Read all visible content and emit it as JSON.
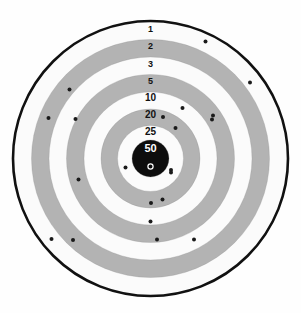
{
  "target": {
    "title": "Shooting Target",
    "center": {
      "x": 150.5,
      "y": 158.5
    },
    "background_color": "#fefefe",
    "band_color_gray": "#b3b3b3",
    "band_color_white": "#fbfbfb",
    "outline_color": "#111111",
    "bullseye_color": "#0d0d0d",
    "bullet_hole_color": "#1a1a1a",
    "outer_rim": {
      "name": "outer-rim",
      "radius": 137.5,
      "stroke_width": 2.6,
      "stroke_color": "#111111"
    },
    "rings": [
      {
        "label": "1",
        "score": 1,
        "outer_radius": 136.0,
        "inner_radius": 119.0,
        "fill": "#fbfbfb",
        "label_y": 31.5
      },
      {
        "label": "2",
        "score": 2,
        "outer_radius": 119.0,
        "inner_radius": 101.5,
        "fill": "#b3b3b3",
        "label_y": 49.0
      },
      {
        "label": "3",
        "score": 3,
        "outer_radius": 101.5,
        "inner_radius": 84.0,
        "fill": "#fbfbfb",
        "label_y": 66.5
      },
      {
        "label": "5",
        "score": 5,
        "outer_radius": 84.0,
        "inner_radius": 66.5,
        "fill": "#b3b3b3",
        "label_y": 84.0
      },
      {
        "label": "10",
        "score": 10,
        "outer_radius": 66.5,
        "inner_radius": 49.5,
        "fill": "#fbfbfb",
        "label_y": 101.0
      },
      {
        "label": "20",
        "score": 20,
        "outer_radius": 49.5,
        "inner_radius": 33.0,
        "fill": "#b3b3b3",
        "label_y": 118.0
      },
      {
        "label": "25",
        "score": 25,
        "outer_radius": 33.0,
        "inner_radius": 18.5,
        "fill": "#fbfbfb",
        "label_y": 134.5
      },
      {
        "label": "50",
        "score": 50,
        "outer_radius": 18.5,
        "inner_radius": 0.0,
        "fill": "#0d0d0d",
        "label_y": 151.5
      }
    ],
    "aim_marker": {
      "name": "aim-point-marker",
      "cx": 150.5,
      "cy": 166.5,
      "radius": 2.6,
      "stroke_color": "#ffffff",
      "stroke_width": 1.2
    },
    "bullet_holes": {
      "count": 21,
      "radius": 2.0,
      "points": [
        {
          "x": 205.5,
          "y": 41.5,
          "ring": "2"
        },
        {
          "x": 250.0,
          "y": 82.5,
          "ring": "3"
        },
        {
          "x": 69.5,
          "y": 89.5,
          "ring": "3"
        },
        {
          "x": 48.5,
          "y": 118.0,
          "ring": "2"
        },
        {
          "x": 75.5,
          "y": 119.0,
          "ring": "5"
        },
        {
          "x": 182.5,
          "y": 108.0,
          "ring": "10"
        },
        {
          "x": 213.0,
          "y": 115.5,
          "ring": "5"
        },
        {
          "x": 163.0,
          "y": 117.0,
          "ring": "20"
        },
        {
          "x": 212.0,
          "y": 119.5,
          "ring": "5"
        },
        {
          "x": 175.5,
          "y": 128.0,
          "ring": "20"
        },
        {
          "x": 125.5,
          "y": 167.5,
          "ring": "25"
        },
        {
          "x": 171.0,
          "y": 172.5,
          "ring": "25"
        },
        {
          "x": 171.0,
          "y": 170.0,
          "ring": "25"
        },
        {
          "x": 78.5,
          "y": 179.5,
          "ring": "20"
        },
        {
          "x": 162.5,
          "y": 199.5,
          "ring": "20"
        },
        {
          "x": 151.0,
          "y": 203.0,
          "ring": "20"
        },
        {
          "x": 150.5,
          "y": 221.5,
          "ring": "10"
        },
        {
          "x": 157.0,
          "y": 239.5,
          "ring": "5"
        },
        {
          "x": 194.0,
          "y": 239.5,
          "ring": "3"
        },
        {
          "x": 73.0,
          "y": 240.0,
          "ring": "3"
        },
        {
          "x": 51.5,
          "y": 239.0,
          "ring": "2"
        }
      ]
    }
  }
}
